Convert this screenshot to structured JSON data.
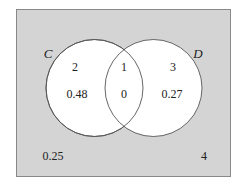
{
  "diagram": {
    "type": "venn",
    "colors": {
      "universe_fill": "#d4d4d4",
      "circle_fill": "#ffffff",
      "stroke": "#555555",
      "text": "#222222"
    },
    "sets": [
      {
        "name": "C",
        "label": "C"
      },
      {
        "name": "D",
        "label": "D"
      }
    ],
    "regions": {
      "c_only": {
        "count": "2",
        "probability": "0.48"
      },
      "c_and_d": {
        "count": "1",
        "probability": "0"
      },
      "d_only": {
        "count": "3",
        "probability": "0.27"
      },
      "outside": {
        "count": "4",
        "probability": "0.25"
      }
    }
  }
}
